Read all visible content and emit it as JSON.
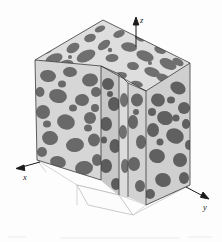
{
  "figure": {
    "name": "three-dimensional-microstructure-cube",
    "background_color": "#fdfdfd"
  },
  "axes": {
    "z": {
      "label": "z",
      "direction": "up"
    },
    "x": {
      "label": "x",
      "direction": "lower-left"
    },
    "y": {
      "label": "y",
      "direction": "lower-right"
    },
    "line_color": "#1b1b1b",
    "arrow_color": "#1b1b1b"
  },
  "phases": {
    "matrix": {
      "name": "light-matrix-phase",
      "color": "#d9d9d9"
    },
    "inclusion": {
      "name": "dark-inclusion-phase",
      "color": "#6e6e6e"
    }
  },
  "faces": {
    "top": {
      "name": "top-face",
      "matrix": "#dedede",
      "inclusion": "#6f6f6f"
    },
    "left": {
      "name": "left-front-face",
      "matrix": "#d6d6d6",
      "inclusion": "#696969"
    },
    "right": {
      "name": "right-front-face",
      "matrix": "#cfcfcf",
      "inclusion": "#606060"
    },
    "notch_left": {
      "name": "notch-left-inner-face",
      "matrix": "#c8c8c8",
      "inclusion": "#5c5c5c"
    },
    "notch_right": {
      "name": "notch-right-inner-face",
      "matrix": "#d2d2d2",
      "inclusion": "#666666"
    },
    "notch_floor": {
      "name": "notch-floor",
      "color": "#fbfbfb"
    }
  },
  "edges": {
    "solid_color": "#3a3a3a",
    "hidden_color": "#b9b9b9"
  }
}
